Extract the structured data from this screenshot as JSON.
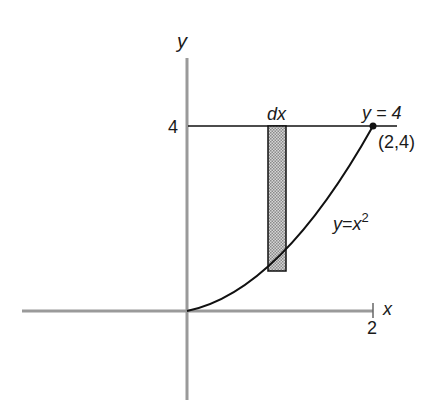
{
  "diagram": {
    "axes": {
      "x_label": "x",
      "y_label": "y",
      "x_tick_label": "2",
      "y_tick_label": "4",
      "axis_color": "#9a9a9a"
    },
    "curve": {
      "label_y": "y",
      "label_eq": "=",
      "label_x": "x",
      "label_exp": "2",
      "color": "#111111"
    },
    "horizontal_line": {
      "label": "y = 4",
      "color": "#111111"
    },
    "point": {
      "label": "(2,4)"
    },
    "strip": {
      "label": "dx",
      "fill": "#c8c8c8"
    }
  }
}
